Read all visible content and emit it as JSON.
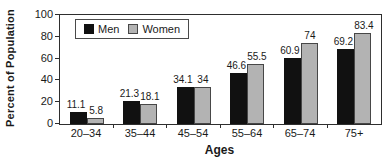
{
  "chart_data": {
    "type": "bar",
    "title": "",
    "xlabel": "Ages",
    "ylabel": "Percent of Population",
    "categories": [
      "20–34",
      "35–44",
      "45–54",
      "55–64",
      "65–74",
      "75+"
    ],
    "series": [
      {
        "name": "Men",
        "color": "#111111",
        "values": [
          11.1,
          21.3,
          34.1,
          46.6,
          60.9,
          69.2
        ],
        "labels": [
          "11.1",
          "21.3",
          "34.1",
          "46.6",
          "60.9",
          "69.2"
        ]
      },
      {
        "name": "Women",
        "color": "#b3b3b3",
        "values": [
          5.8,
          18.1,
          34,
          55.5,
          74,
          83.4
        ],
        "labels": [
          "5.8",
          "18.1",
          "34",
          "55.5",
          "74",
          "83.4"
        ]
      }
    ],
    "ylim": [
      0,
      100
    ],
    "yticks": [
      0,
      20,
      40,
      60,
      80,
      100
    ],
    "grid": false,
    "legend_position": "top-left",
    "axis_color": "#2e2e2e",
    "background_color": "#ffffff"
  }
}
